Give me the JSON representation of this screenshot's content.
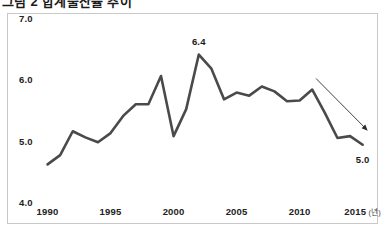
{
  "figure": {
    "clipped_title": "그림 2 합계출산율 추이",
    "frame_color": "#c9c9c9",
    "background": "#ffffff"
  },
  "chart_data": {
    "type": "line",
    "title": "",
    "subtitle": "",
    "xlabel": "",
    "ylabel": "",
    "x_unit_label": "(년)",
    "xlim": [
      1989.4,
      2015.9
    ],
    "ylim": [
      4.0,
      7.0
    ],
    "grid": false,
    "legend": null,
    "line_color": "#4a4a4a",
    "line_width": 2.6,
    "y_ticks": [
      "7.0",
      "6.0",
      "5.0",
      "4.0"
    ],
    "y_tick_values": [
      7.0,
      6.0,
      5.0,
      4.0
    ],
    "x_ticks": [
      "1990",
      "1995",
      "2000",
      "2005",
      "2010",
      "2015"
    ],
    "x_tick_values": [
      1990,
      1995,
      2000,
      2005,
      2010,
      2015
    ],
    "x": [
      1990,
      1991,
      1992,
      1993,
      1994,
      1995,
      1996,
      1997,
      1998,
      1999,
      2000,
      2001,
      2002,
      2003,
      2004,
      2005,
      2006,
      2007,
      2008,
      2009,
      2010,
      2011,
      2012,
      2013,
      2014,
      2015
    ],
    "values": [
      4.63,
      4.78,
      5.17,
      5.07,
      4.99,
      5.14,
      5.42,
      5.61,
      5.61,
      6.07,
      5.09,
      5.53,
      6.42,
      6.19,
      5.69,
      5.8,
      5.75,
      5.9,
      5.82,
      5.66,
      5.67,
      5.85,
      5.47,
      5.06,
      5.09,
      4.95
    ],
    "annotations": [
      {
        "name": "peak-value-label",
        "text": "6.4",
        "x": 2002,
        "y": 6.42,
        "placement": "above"
      },
      {
        "name": "end-value-label",
        "text": "5.0",
        "x": 2015,
        "y": 4.95,
        "placement": "below"
      },
      {
        "name": "downtrend-arrow",
        "text": "",
        "from": {
          "x": 2011.3,
          "y": 6.03
        },
        "to": {
          "x": 2015.4,
          "y": 5.18
        },
        "color": "#2b2b2b"
      }
    ]
  }
}
